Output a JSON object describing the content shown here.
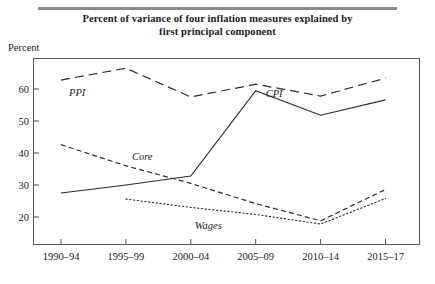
{
  "figure": {
    "title_line1": "Percent of variance of four inflation measures explained by",
    "title_line2": "first principal component",
    "axis_label": "Percent"
  },
  "chart_data": {
    "type": "line",
    "title": "Percent of variance of four inflation measures explained by first principal component",
    "xlabel": "",
    "ylabel": "Percent",
    "ylim": [
      14,
      70
    ],
    "yticks": [
      20,
      30,
      40,
      50,
      60
    ],
    "ytick_labels": [
      "20",
      "30",
      "40",
      "50",
      "60"
    ],
    "grid": false,
    "legend": "inline-labels",
    "categories": [
      "1990–94",
      "1995–99",
      "2000–04",
      "2005–09",
      "2010–14",
      "2015–17"
    ],
    "series": [
      {
        "name": "PPI",
        "style": "long-dashed",
        "label_x_category": "1990–94",
        "values": [
          62.8,
          66.5,
          57.5,
          61.5,
          57.8,
          63.4
        ]
      },
      {
        "name": "Core",
        "style": "dashed",
        "label_x_category": "1995–99",
        "values": [
          42.6,
          36.0,
          30.5,
          24.2,
          18.8,
          28.6
        ]
      },
      {
        "name": "CPI",
        "style": "solid",
        "label_x_category": "2005–09",
        "values": [
          27.5,
          30.0,
          32.8,
          59.5,
          51.8,
          56.6
        ]
      },
      {
        "name": "Wages",
        "style": "dotted",
        "label_x_category": "2000–04",
        "values": [
          null,
          25.6,
          23.0,
          20.8,
          17.8,
          25.8
        ]
      }
    ]
  }
}
